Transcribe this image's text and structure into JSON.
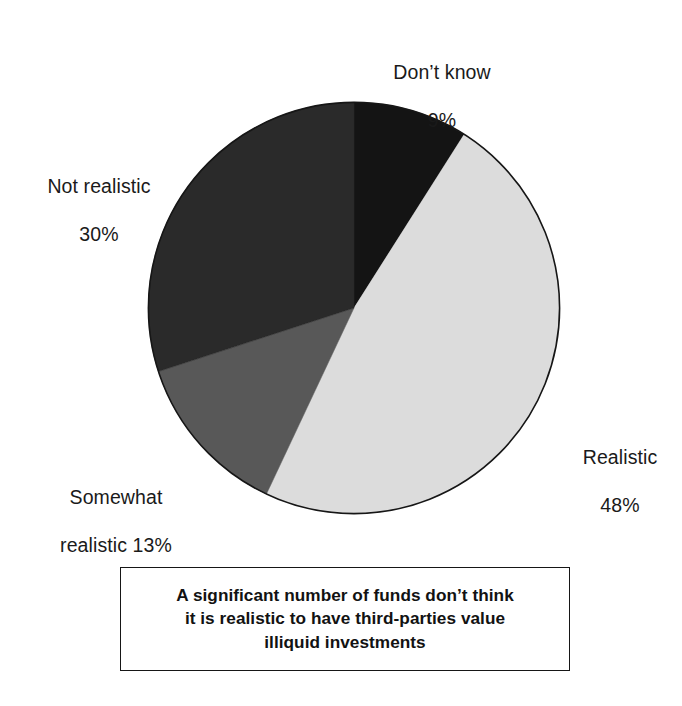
{
  "chart_data": {
    "type": "pie",
    "title": "",
    "subtitle": "",
    "xlabel": "",
    "ylabel": "",
    "legend_position": "callout-labels",
    "grid": false,
    "units": "percent",
    "total": 100,
    "start_angle_deg": 0,
    "direction": "clockwise",
    "categories": [
      "Don't know",
      "Realistic",
      "Somewhat realistic",
      "Not realistic"
    ],
    "values": [
      9,
      48,
      13,
      30
    ],
    "slices": [
      {
        "label": "Don't know",
        "value": 9,
        "value_text": "9%",
        "color": "#141414",
        "label_lines": [
          "Don’t know",
          "9%"
        ],
        "label_position": "top"
      },
      {
        "label": "Realistic",
        "value": 48,
        "value_text": "48%",
        "color": "#dcdcdc",
        "label_lines": [
          "Realistic",
          "48%"
        ],
        "label_position": "right"
      },
      {
        "label": "Somewhat realistic",
        "value": 13,
        "value_text": "13%",
        "color": "#585858",
        "label_lines": [
          "Somewhat",
          "realistic 13%"
        ],
        "label_position": "bottom-left"
      },
      {
        "label": "Not realistic",
        "value": 30,
        "value_text": "30%",
        "color": "#2a2a2a",
        "label_lines": [
          "Not realistic",
          "30%"
        ],
        "label_position": "top-left"
      }
    ],
    "annotations": [
      "A significant number of funds don’t think it is realistic to have third-parties value illiquid investments"
    ]
  },
  "labels": {
    "dont_know": {
      "line1": "Don’t know",
      "line2": "9%"
    },
    "not_realistic": {
      "line1": "Not realistic",
      "line2": "30%"
    },
    "somewhat_realistic": {
      "line1": "Somewhat",
      "line2": "realistic 13%"
    },
    "realistic": {
      "line1": "Realistic",
      "line2": "48%"
    }
  },
  "caption": {
    "line1": "A significant number of funds don’t think",
    "line2": "it is realistic to have third-parties value",
    "line3": "illiquid investments"
  },
  "colors": {
    "dont_know": "#141414",
    "realistic": "#dcdcdc",
    "somewhat_realistic": "#585858",
    "not_realistic": "#2a2a2a",
    "outline": "#161616",
    "background": "#ffffff",
    "text": "#1a1a1a"
  }
}
